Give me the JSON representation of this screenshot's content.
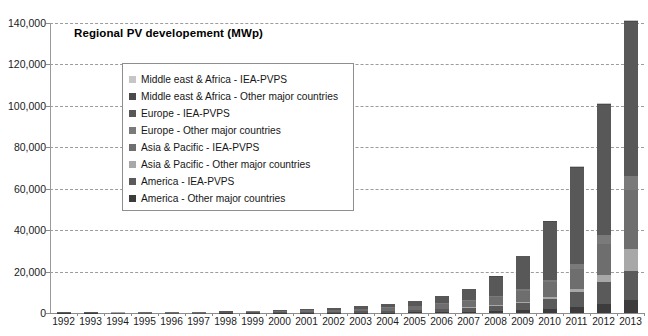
{
  "chart_data": {
    "type": "bar",
    "subtype": "stacked-bar",
    "title": "Regional PV developement (MWp)",
    "xlabel": "",
    "ylabel": "",
    "ylim": [
      0,
      140000
    ],
    "ytick_step": 20000,
    "ytick_labels": [
      "140,000",
      "120,000",
      "100,000",
      "80,000",
      "60,000",
      "40,000",
      "20,000",
      "0"
    ],
    "ytick_values": [
      140000,
      120000,
      100000,
      80000,
      60000,
      40000,
      20000,
      0
    ],
    "grid": true,
    "grid_style": "dashed",
    "legend_position": "inside-upper-left",
    "categories": [
      "1992",
      "1993",
      "1994",
      "1995",
      "1996",
      "1997",
      "1998",
      "1999",
      "2000",
      "2001",
      "2002",
      "2003",
      "2004",
      "2005",
      "2006",
      "2007",
      "2008",
      "2009",
      "2010",
      "2011",
      "2012",
      "2013"
    ],
    "series": [
      {
        "name": "America - Other major countries",
        "color": "#3c3c3c",
        "values": [
          10,
          12,
          15,
          18,
          22,
          28,
          35,
          45,
          60,
          80,
          110,
          150,
          210,
          300,
          420,
          600,
          900,
          1300,
          1900,
          2900,
          4300,
          6200
        ]
      },
      {
        "name": "America - IEA-PVPS",
        "color": "#5a5a5a",
        "values": [
          55,
          70,
          90,
          110,
          140,
          175,
          220,
          270,
          330,
          400,
          500,
          620,
          800,
          1050,
          1400,
          1900,
          2600,
          3600,
          5100,
          7300,
          10500,
          14300
        ]
      },
      {
        "name": "Asia & Pacific - Other major countries",
        "color": "#a8a8a8",
        "values": [
          5,
          6,
          8,
          10,
          13,
          17,
          22,
          28,
          36,
          48,
          64,
          85,
          115,
          160,
          220,
          310,
          430,
          620,
          900,
          1500,
          3500,
          10500
        ]
      },
      {
        "name": "Asia & Pacific - IEA-PVPS",
        "color": "#6e6e6e",
        "values": [
          40,
          55,
          75,
          100,
          135,
          185,
          260,
          370,
          520,
          700,
          900,
          1150,
          1500,
          1900,
          2400,
          3100,
          4000,
          5200,
          6900,
          9600,
          15000,
          28500
        ]
      },
      {
        "name": "Europe - Other major countries",
        "color": "#7a7a7a",
        "values": [
          3,
          4,
          5,
          7,
          9,
          12,
          16,
          21,
          28,
          38,
          52,
          72,
          100,
          145,
          210,
          310,
          470,
          750,
          1300,
          2400,
          4200,
          6800
        ]
      },
      {
        "name": "Europe - IEA-PVPS",
        "color": "#585858",
        "values": [
          30,
          42,
          58,
          78,
          105,
          140,
          190,
          260,
          360,
          520,
          760,
          1100,
          1600,
          2400,
          3500,
          5400,
          9200,
          16000,
          28000,
          46500,
          63000,
          74000
        ]
      },
      {
        "name": "Middle east & Africa - Other major countries",
        "color": "#4a4a4a",
        "values": [
          1,
          1,
          2,
          2,
          3,
          4,
          5,
          7,
          9,
          12,
          16,
          22,
          30,
          42,
          58,
          80,
          110,
          155,
          220,
          330,
          520,
          820
        ]
      },
      {
        "name": "Middle east & Africa - IEA-PVPS",
        "color": "#c6c6c6",
        "values": [
          1,
          1,
          1,
          2,
          2,
          3,
          4,
          5,
          7,
          9,
          12,
          16,
          22,
          30,
          42,
          58,
          80,
          110,
          155,
          230,
          360,
          560
        ]
      }
    ],
    "totals": [
      145,
      191,
      254,
      327,
      429,
      564,
      752,
      1006,
      1350,
      1807,
      2414,
      3215,
      4377,
      6027,
      8250,
      11758,
      17790,
      27735,
      44475,
      70760,
      101380,
      141680
    ],
    "annotations": []
  },
  "legend": {
    "items": [
      {
        "label": "Middle east & Africa - IEA-PVPS",
        "color": "#c6c6c6"
      },
      {
        "label": "Middle east & Africa - Other major countries",
        "color": "#4a4a4a"
      },
      {
        "label": "Europe - IEA-PVPS",
        "color": "#585858"
      },
      {
        "label": "Europe - Other major countries",
        "color": "#7a7a7a"
      },
      {
        "label": "Asia & Pacific - IEA-PVPS",
        "color": "#6e6e6e"
      },
      {
        "label": "Asia & Pacific - Other major countries",
        "color": "#a8a8a8"
      },
      {
        "label": "America - IEA-PVPS",
        "color": "#5a5a5a"
      },
      {
        "label": "America - Other major countries",
        "color": "#3c3c3c"
      }
    ]
  },
  "style": {
    "background": "#ffffff",
    "grid_color": "#9c9c9c",
    "axis_color": "#8c8c8c",
    "text_color": "#1b1b1b"
  }
}
